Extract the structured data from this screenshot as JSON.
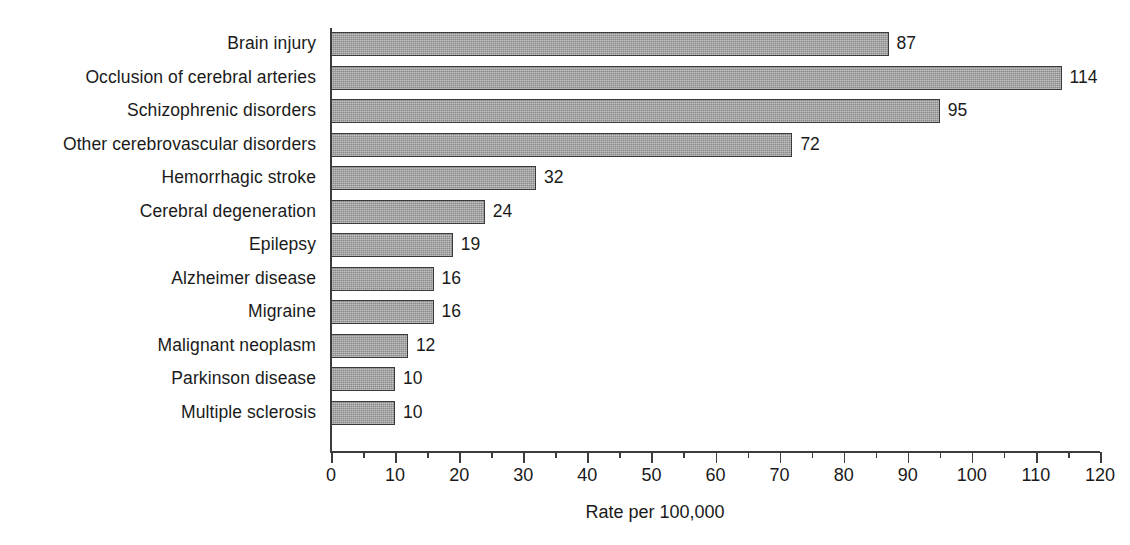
{
  "chart_data": {
    "type": "bar",
    "orientation": "horizontal",
    "title": "",
    "subtitle": "",
    "xlabel": "Rate per 100,000",
    "ylabel": "",
    "xlim": [
      0,
      120
    ],
    "ylim": null,
    "grid": false,
    "legend": null,
    "legend_position": "none",
    "x_major_step": 10,
    "x_minor_step": 5,
    "x_tick_labels": [
      "0",
      "10",
      "20",
      "30",
      "40",
      "50",
      "60",
      "70",
      "80",
      "90",
      "100",
      "110",
      "120"
    ],
    "x_tick_values": [
      0,
      10,
      20,
      30,
      40,
      50,
      60,
      70,
      80,
      90,
      100,
      110,
      120
    ],
    "value_labels_shown": true,
    "categories": [
      "Brain injury",
      "Occlusion of cerebral arteries",
      "Schizophrenic disorders",
      "Other cerebrovascular disorders",
      "Hemorrhagic stroke",
      "Cerebral degeneration",
      "Epilepsy",
      "Alzheimer disease",
      "Migraine",
      "Malignant neoplasm",
      "Parkinson disease",
      "Multiple sclerosis"
    ],
    "values": [
      87,
      114,
      95,
      72,
      32,
      24,
      19,
      16,
      16,
      12,
      10,
      10
    ],
    "value_labels": [
      "87",
      "114",
      "95",
      "72",
      "32",
      "24",
      "19",
      "16",
      "16",
      "12",
      "10",
      "10"
    ],
    "bars": [
      {
        "category": "Brain injury",
        "value": 87,
        "label": "87"
      },
      {
        "category": "Occlusion of cerebral arteries",
        "value": 114,
        "label": "114"
      },
      {
        "category": "Schizophrenic disorders",
        "value": 95,
        "label": "95"
      },
      {
        "category": "Other cerebrovascular disorders",
        "value": 72,
        "label": "72"
      },
      {
        "category": "Hemorrhagic stroke",
        "value": 32,
        "label": "32"
      },
      {
        "category": "Cerebral degeneration",
        "value": 24,
        "label": "24"
      },
      {
        "category": "Epilepsy",
        "value": 19,
        "label": "19"
      },
      {
        "category": "Alzheimer disease",
        "value": 16,
        "label": "16"
      },
      {
        "category": "Migraine",
        "value": 16,
        "label": "16"
      },
      {
        "category": "Malignant neoplasm",
        "value": 12,
        "label": "12"
      },
      {
        "category": "Parkinson disease",
        "value": 10,
        "label": "10"
      },
      {
        "category": "Multiple sclerosis",
        "value": 10,
        "label": "10"
      }
    ],
    "colors": {
      "bar_fill": "#9b9b9b",
      "bar_border": "#3a3a3a",
      "axis": "#3c3c3c",
      "text": "#1a1a1a",
      "background": "#ffffff"
    }
  }
}
